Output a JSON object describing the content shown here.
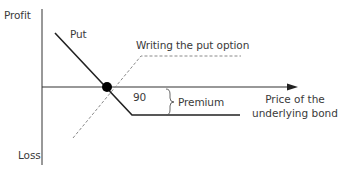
{
  "diagram": {
    "axes": {
      "y_top_label": "Profit",
      "y_bottom_label": "Loss",
      "x_label_line1": "Price of the",
      "x_label_line2": "underlying bond"
    },
    "series": [
      {
        "name": "Put",
        "style": "solid",
        "color": "#222222"
      },
      {
        "name": "Writing the put option",
        "style": "dashed",
        "color": "#8a8a8a"
      }
    ],
    "annotations": {
      "strike": "90",
      "premium": "Premium"
    },
    "colors": {
      "axis": "#333333",
      "put_line": "#222222",
      "writer_line": "#8a8a8a",
      "dot": "#000000"
    }
  }
}
